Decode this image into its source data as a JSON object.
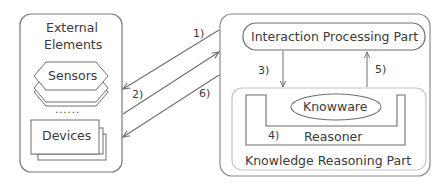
{
  "external_panel": {
    "title_line1": "External",
    "title_line2": "Elements",
    "sensors_label": "Sensors",
    "ellipsis": "......",
    "devices_label": "Devices"
  },
  "system_panel": {
    "interaction_part_label": "Interaction Processing Part",
    "knowledge_part_label": "Knowledge Reasoning Part",
    "knowware_label": "Knowware",
    "reasoner_label": "Reasoner"
  },
  "arrows": {
    "a1": "1)",
    "a2": "2)",
    "a3": "3)",
    "a4": "4)",
    "a5": "5)",
    "a6": "6)"
  },
  "colors": {
    "stroke": "#6e6e6e",
    "light_stroke": "#bdbdbd",
    "text": "#3a3a3a"
  }
}
